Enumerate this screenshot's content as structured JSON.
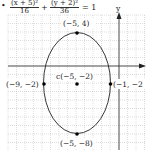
{
  "equation": {
    "bullet": "•",
    "term1": {
      "numerator": "(x + 5)²",
      "denominator": "16"
    },
    "plus": "+",
    "term2": {
      "numerator": "(y + 2)²",
      "denominator": "36"
    },
    "equals": "= 1"
  },
  "axes": {
    "y_label": "y",
    "x_arrow": true,
    "y_arrow": true
  },
  "points": [
    {
      "id": "top-vertex",
      "label": "(−5, 4)",
      "x": -5,
      "y": 4
    },
    {
      "id": "center",
      "label": "c(−5, −2)",
      "x": -5,
      "y": -2
    },
    {
      "id": "left-covertex",
      "label": "(−9, −2)",
      "x": -9,
      "y": -2
    },
    {
      "id": "right-covertex",
      "label": "(−1, −2",
      "x": -1,
      "y": -2
    },
    {
      "id": "bottom-vertex",
      "label": "(−5, −8)",
      "x": -5,
      "y": -8
    }
  ],
  "ellipse": {
    "h": -5,
    "k": -2,
    "a": 4,
    "b": 6
  },
  "colors": {
    "grid": "#b8b8b8",
    "axis": "#333333",
    "curve": "#222222",
    "point": "#000000"
  }
}
